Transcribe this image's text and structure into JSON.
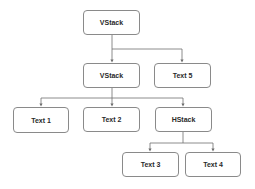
{
  "diagram": {
    "type": "tree",
    "nodes": [
      {
        "id": "root",
        "label": "VStack"
      },
      {
        "id": "vstack",
        "label": "VStack"
      },
      {
        "id": "text5",
        "label": "Text 5"
      },
      {
        "id": "text1",
        "label": "Text 1"
      },
      {
        "id": "text2",
        "label": "Text 2"
      },
      {
        "id": "hstack",
        "label": "HStack"
      },
      {
        "id": "text3",
        "label": "Text 3"
      },
      {
        "id": "text4",
        "label": "Text 4"
      }
    ],
    "edges": [
      {
        "from": "root",
        "to": "vstack"
      },
      {
        "from": "root",
        "to": "text5"
      },
      {
        "from": "vstack",
        "to": "text1"
      },
      {
        "from": "vstack",
        "to": "text2"
      },
      {
        "from": "vstack",
        "to": "hstack"
      },
      {
        "from": "hstack",
        "to": "text3"
      },
      {
        "from": "hstack",
        "to": "text4"
      }
    ]
  },
  "colors": {
    "node_border": "#8a8a8a",
    "edge": "#6e6e6e",
    "text": "#2a2a2a"
  }
}
